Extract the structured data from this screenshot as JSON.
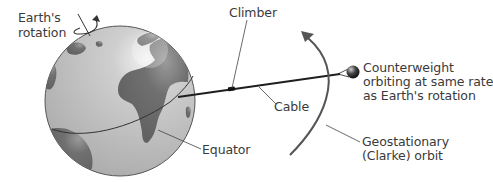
{
  "diagram": {
    "labels": {
      "earth_rotation_line1": "Earth's",
      "earth_rotation_line2": "rotation",
      "climber": "Climber",
      "cable": "Cable",
      "counterweight_line1": "Counterweight",
      "counterweight_line2": "orbiting at same rate",
      "counterweight_line3": "as Earth's rotation",
      "equator": "Equator",
      "orbit_line1": "Geostationary",
      "orbit_line2": "(Clarke) orbit"
    },
    "elements": [
      {
        "id": "earth",
        "shape": "globe"
      },
      {
        "id": "rotation-arrow",
        "shape": "curved-arrow"
      },
      {
        "id": "equator",
        "shape": "curve"
      },
      {
        "id": "cable",
        "shape": "line"
      },
      {
        "id": "climber",
        "shape": "small-box"
      },
      {
        "id": "counterweight",
        "shape": "sphere"
      },
      {
        "id": "geostationary-orbit",
        "shape": "arc-arrow"
      }
    ],
    "colors": {
      "ocean": "#bdbdbd",
      "land": "#6e6e6e",
      "line": "#2a2a2a",
      "orbit": "#555555",
      "text": "#3a3a3a"
    }
  }
}
